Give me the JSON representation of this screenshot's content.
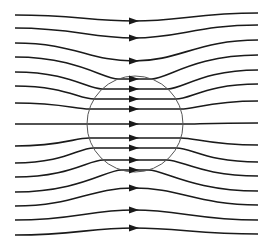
{
  "diagram": {
    "title": "",
    "colors": {
      "background": "#ffffff",
      "line": "#1a1a1a",
      "circle": "#555555"
    },
    "circle": {
      "cx": 135,
      "cy": 124,
      "r": 48
    },
    "x_start": 15,
    "x_end": 258,
    "arrow_x": 134,
    "streamlines": [
      {
        "y_left": 15,
        "y_mid": 21,
        "y_right": 13
      },
      {
        "y_left": 28,
        "y_mid": 38,
        "y_right": 25
      },
      {
        "y_left": 43,
        "y_mid": 61,
        "y_right": 40
      },
      {
        "y_left": 57,
        "y_mid": 79,
        "y_right": 55
      },
      {
        "y_left": 72,
        "y_mid": 89,
        "y_right": 70
      },
      {
        "y_left": 86,
        "y_mid": 99,
        "y_right": 84
      },
      {
        "y_left": 103,
        "y_mid": 109,
        "y_right": 101
      },
      {
        "y_left": 124,
        "y_mid": 124,
        "y_right": 123
      },
      {
        "y_left": 146,
        "y_mid": 138,
        "y_right": 145
      },
      {
        "y_left": 163,
        "y_mid": 148,
        "y_right": 162
      },
      {
        "y_left": 177,
        "y_mid": 160,
        "y_right": 176
      },
      {
        "y_left": 192,
        "y_mid": 170,
        "y_right": 191
      },
      {
        "y_left": 206,
        "y_mid": 188,
        "y_right": 205
      },
      {
        "y_left": 220,
        "y_mid": 210,
        "y_right": 220
      },
      {
        "y_left": 235,
        "y_mid": 228,
        "y_right": 234
      }
    ]
  }
}
